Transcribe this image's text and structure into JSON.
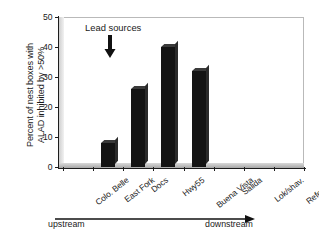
{
  "chart_data": {
    "type": "bar",
    "title": "",
    "xlabel": "",
    "ylabel": "Percent of nest boxes with ALAD inhibited by >50%",
    "ylabel_line1": "Percent of nest boxes with",
    "ylabel_line2": "ALAD inhibited by >50%",
    "categories": [
      "Colo. Belle",
      "East Fork",
      "Docs",
      "Hwy55",
      "Buena Vista",
      "Salida",
      "Lok/shav.",
      "Reference"
    ],
    "values": [
      0,
      8,
      26,
      40,
      32,
      0,
      0,
      0
    ],
    "ylim": [
      0,
      50
    ],
    "yticks": [
      0,
      10,
      20,
      30,
      40,
      50
    ],
    "ytick_labels": [
      "0",
      "10",
      "20",
      "30",
      "40",
      "50"
    ],
    "grid": false,
    "legend": "none",
    "bar_color": "#141414",
    "annotations": [
      {
        "name": "lead-sources",
        "text": "Lead sources",
        "arrow": "down",
        "points_to_category": "East Fork"
      },
      {
        "name": "flow-direction",
        "left_label": "upstream",
        "right_label": "downstream",
        "arrow": "right"
      }
    ]
  },
  "axis": {
    "y_title_line1": "Percent of nest boxes with",
    "y_title_line2": "ALAD inhibited by >50%"
  },
  "footer": {
    "upstream_label": "upstream",
    "downstream_label": "downstream"
  },
  "annotation": {
    "lead_sources_label": "Lead sources"
  }
}
